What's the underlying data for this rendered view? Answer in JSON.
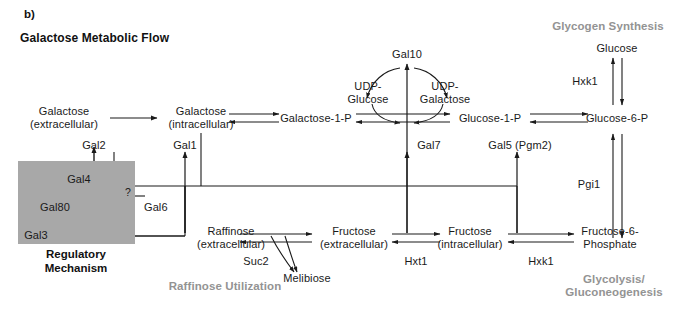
{
  "figure": {
    "panel_label": "b)",
    "title": "Galactose Metabolic Flow",
    "background_color": "#ffffff",
    "line_color": "#1a1a1a",
    "gray_label_color": "#939393",
    "regulatory_box_color": "#a8a8a8"
  },
  "section_labels": {
    "glycogen_synthesis": "Glycogen Synthesis",
    "raffinose_utilization": "Raffinose Utilization",
    "glycolysis": "Glycolysis/\nGluconeogenesis",
    "regulatory_mechanism": "Regulatory\nMechanism"
  },
  "metabolites": {
    "galactose_extracellular": "Galactose\n(extracellular)",
    "galactose_intracellular": "Galactose\n(intracellular)",
    "galactose_1_p": "Galactose-1-P",
    "udp_glucose": "UDP-\nGlucose",
    "udp_galactose": "UDP-\nGalactose",
    "glucose_1_p": "Glucose-1-P",
    "glucose_6_p": "Glucose-6-P",
    "glucose": "Glucose",
    "raffinose_extracellular": "Raffinose\n(extracellular)",
    "melibiose": "Melibiose",
    "fructose_extracellular": "Fructose\n(extracellular)",
    "fructose_intracellular": "Fructose\n(intracellular)",
    "fructose_6_phosphate": "Fructose-6-\nPhosphate"
  },
  "enzymes": {
    "gal2": "Gal2",
    "gal1": "Gal1",
    "gal7": "Gal7",
    "gal10": "Gal10",
    "gal5_pgm2": "Gal5 (Pgm2)",
    "hxk1_top": "Hxk1",
    "pgi1": "Pgi1",
    "suc2": "Suc2",
    "hxt1": "Hxt1",
    "hxk1_bottom": "Hxk1"
  },
  "regulators": {
    "gal4": "Gal4",
    "gal80": "Gal80",
    "gal3": "Gal3",
    "gal6": "Gal6",
    "unknown_marker": "?"
  }
}
